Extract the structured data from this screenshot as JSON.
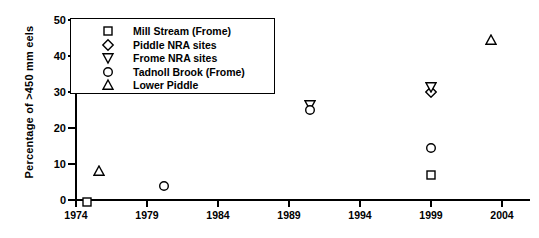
{
  "chart_data": {
    "type": "scatter",
    "title": "",
    "xlabel": "",
    "ylabel": "Percentage of >450 mm eels",
    "xlim": [
      1974,
      2006
    ],
    "ylim": [
      0,
      50
    ],
    "xticks": [
      1974,
      1979,
      1984,
      1989,
      1994,
      1999,
      2004
    ],
    "yticks": [
      0,
      10,
      20,
      30,
      40,
      50
    ],
    "grid": false,
    "legend_position": "top-left",
    "series": [
      {
        "name": "Mill Stream (Frome)",
        "marker": "square",
        "points": [
          {
            "x": 1974.8,
            "y": 0
          },
          {
            "x": 1999.0,
            "y": 7.5
          }
        ]
      },
      {
        "name": "Piddle NRA sites",
        "marker": "diamond",
        "points": [
          {
            "x": 1999.0,
            "y": 30.5
          }
        ]
      },
      {
        "name": "Frome NRA sites",
        "marker": "triangle-down",
        "points": [
          {
            "x": 1990.5,
            "y": 27.0
          },
          {
            "x": 1999.0,
            "y": 32.0
          }
        ]
      },
      {
        "name": "Tadnoll Brook (Frome)",
        "marker": "circle",
        "points": [
          {
            "x": 1980.2,
            "y": 4.5
          },
          {
            "x": 1990.5,
            "y": 25.5
          },
          {
            "x": 1999.0,
            "y": 15.0
          }
        ]
      },
      {
        "name": "Lower Piddle",
        "marker": "triangle-up",
        "points": [
          {
            "x": 1975.6,
            "y": 8.5
          },
          {
            "x": 2003.2,
            "y": 45.0
          }
        ]
      }
    ]
  },
  "colors": {
    "axis": "#000000",
    "marker_stroke": "#000000",
    "marker_fill": "#ffffff",
    "background": "#ffffff"
  }
}
